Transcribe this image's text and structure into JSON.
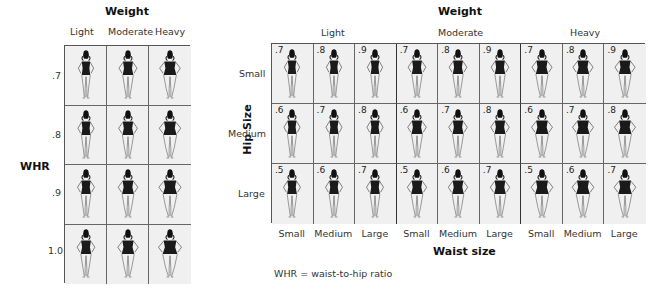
{
  "left_panel": {
    "title": "Weight",
    "columns": [
      "Light",
      "Moderate",
      "Heavy"
    ],
    "row_axis_label": "WHR",
    "rows": [
      ".7",
      ".8",
      ".9",
      "1.0"
    ],
    "figure_icon": "woman-swimsuit-figure-icon"
  },
  "right_panel": {
    "title": "Weight",
    "groups": [
      "Light",
      "Moderate",
      "Heavy"
    ],
    "row_axis_label": "Hip Size",
    "rows": [
      "Small",
      "Medium",
      "Large"
    ],
    "x_axis_label": "Waist size",
    "columns": [
      "Small",
      "Medium",
      "Large",
      "Small",
      "Medium",
      "Large",
      "Small",
      "Medium",
      "Large"
    ],
    "cell_values": [
      [
        ".7",
        ".8",
        ".9",
        ".7",
        ".8",
        ".9",
        ".7",
        ".8",
        ".9"
      ],
      [
        ".6",
        ".7",
        ".8",
        ".6",
        ".7",
        ".8",
        ".6",
        ".7",
        ".8"
      ],
      [
        ".5",
        ".6",
        ".7",
        ".5",
        ".6",
        ".7",
        ".5",
        ".6",
        ".7"
      ]
    ],
    "figure_icon": "woman-swimsuit-figure-icon"
  },
  "footnote": "WHR = waist-to-hip ratio"
}
